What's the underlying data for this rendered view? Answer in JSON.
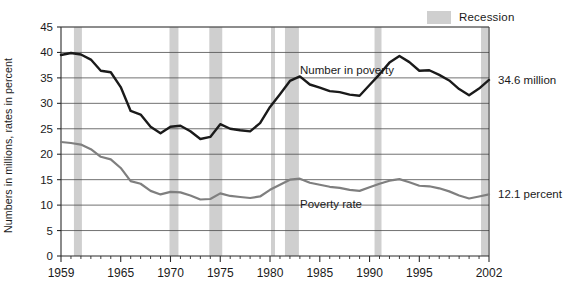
{
  "legend": {
    "items": [
      {
        "label": "Recession",
        "color": "#cfcfcf"
      }
    ]
  },
  "annotations": {
    "number_end_label": "34.6 million",
    "rate_end_label": "12.1 percent",
    "number_series_label": "Number in poverty",
    "rate_series_label": "Poverty rate"
  },
  "chart_data": {
    "type": "line",
    "title": "",
    "subtitle": "",
    "xlabel": "",
    "ylabel": "Numbers in millions, rates in percent",
    "xlim": [
      1959,
      2002
    ],
    "ylim": [
      0,
      45
    ],
    "grid": true,
    "legend_position": "top-right",
    "y_ticks": [
      0,
      5,
      10,
      15,
      20,
      25,
      30,
      35,
      40,
      45
    ],
    "y_tick_labels": [
      "0",
      "5",
      "10",
      "15",
      "20",
      "25",
      "30",
      "35",
      "40",
      "45"
    ],
    "x_ticks_labeled": [
      1959,
      1965,
      1970,
      1975,
      1980,
      1985,
      1990,
      1995,
      2002
    ],
    "x_tick_labels": [
      "1959",
      "1965",
      "1970",
      "1975",
      "1980",
      "1985",
      "1990",
      "1995",
      "2002"
    ],
    "x": [
      1959,
      1960,
      1961,
      1962,
      1963,
      1964,
      1965,
      1966,
      1967,
      1968,
      1969,
      1970,
      1971,
      1972,
      1973,
      1974,
      1975,
      1976,
      1977,
      1978,
      1979,
      1980,
      1981,
      1982,
      1983,
      1984,
      1985,
      1986,
      1987,
      1988,
      1989,
      1990,
      1991,
      1992,
      1993,
      1994,
      1995,
      1996,
      1997,
      1998,
      1999,
      2000,
      2001,
      2002
    ],
    "series": [
      {
        "name": "Number in poverty",
        "units": "millions",
        "color": "#1a1a1a",
        "width": 2.4,
        "end_value": 34.6,
        "values": [
          39.5,
          39.9,
          39.6,
          38.6,
          36.4,
          36.1,
          33.2,
          28.5,
          27.8,
          25.4,
          24.1,
          25.4,
          25.6,
          24.5,
          23.0,
          23.4,
          25.9,
          25.0,
          24.7,
          24.5,
          26.1,
          29.3,
          31.8,
          34.4,
          35.3,
          33.7,
          33.1,
          32.4,
          32.2,
          31.7,
          31.5,
          33.6,
          35.7,
          38.0,
          39.3,
          38.1,
          36.4,
          36.5,
          35.6,
          34.5,
          32.8,
          31.6,
          32.9,
          34.6
        ]
      },
      {
        "name": "Poverty rate",
        "units": "percent",
        "color": "#7f7f7f",
        "width": 2.2,
        "end_value": 12.1,
        "values": [
          22.4,
          22.2,
          21.9,
          21.0,
          19.5,
          19.0,
          17.3,
          14.7,
          14.2,
          12.8,
          12.1,
          12.6,
          12.5,
          11.9,
          11.1,
          11.2,
          12.3,
          11.8,
          11.6,
          11.4,
          11.7,
          13.0,
          14.0,
          15.0,
          15.2,
          14.4,
          14.0,
          13.6,
          13.4,
          13.0,
          12.8,
          13.5,
          14.2,
          14.8,
          15.1,
          14.5,
          13.8,
          13.7,
          13.3,
          12.7,
          11.9,
          11.3,
          11.7,
          12.1
        ]
      }
    ],
    "recession_bands": [
      {
        "start": 1960.3,
        "end": 1961.1
      },
      {
        "start": 1969.9,
        "end": 1970.8
      },
      {
        "start": 1973.9,
        "end": 1975.2
      },
      {
        "start": 1980.1,
        "end": 1980.5
      },
      {
        "start": 1981.5,
        "end": 1982.9
      },
      {
        "start": 1990.5,
        "end": 1991.2
      },
      {
        "start": 2001.2,
        "end": 2001.9
      }
    ],
    "recession_color": "#cfcfcf"
  }
}
